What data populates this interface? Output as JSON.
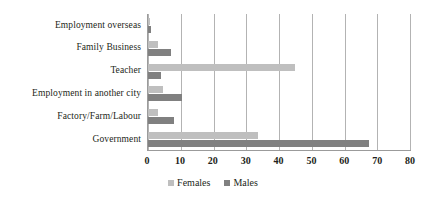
{
  "chart_data": {
    "type": "bar",
    "orientation": "horizontal",
    "title": "",
    "subtitle": "",
    "xlabel": "",
    "ylabel": "",
    "xlim": [
      0,
      80
    ],
    "xticks": [
      0,
      10,
      20,
      30,
      40,
      50,
      60,
      70,
      80
    ],
    "grid": "vertical",
    "legend_position": "bottom-center",
    "categories": [
      "Employment overseas",
      "Family Business",
      "Teacher",
      "Employment in another city",
      "Factory/Farm/Labour",
      "Government"
    ],
    "series": [
      {
        "name": "Females",
        "color": "#bfbfbf",
        "values": [
          0.5,
          3,
          45,
          4.5,
          3,
          33.5
        ]
      },
      {
        "name": "Males",
        "color": "#808080",
        "values": [
          1,
          7,
          4,
          10.5,
          8,
          67.5
        ]
      }
    ]
  },
  "legend": {
    "items": [
      {
        "label": "Females",
        "swatch": "females-swatch"
      },
      {
        "label": "Males",
        "swatch": "males-swatch"
      }
    ]
  },
  "colors": {
    "females": "#bfbfbf",
    "males": "#808080",
    "gridline": "#b3b3b3",
    "axis": "#9b9b9b",
    "text": "#231f20",
    "background": "#ffffff"
  }
}
